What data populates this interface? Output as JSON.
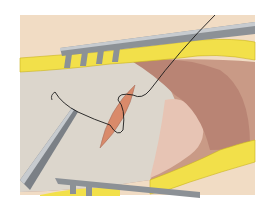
{
  "image": {
    "subject": "surgical illustration of suturing an incision with needle holder and retractors",
    "colors": {
      "background": "#ffffff",
      "skin": "#f1dcc4",
      "fat": "#f2e04a",
      "fat_dark": "#c9b320",
      "membrane": "#dcd6cc",
      "tissue": "#c99a86",
      "tissue_dark": "#a87262",
      "incision": "#d98a6a",
      "metal": "#8c9196",
      "metal_light": "#c7cbcf",
      "suture": "#1a1a1a"
    }
  }
}
